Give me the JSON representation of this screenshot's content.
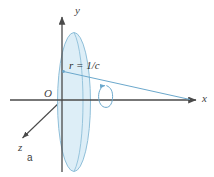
{
  "figure": {
    "caption": "a",
    "type": "3d-axis-diagram",
    "background_color": "#ffffff"
  },
  "axes": {
    "x_label": "x",
    "y_label": "y",
    "z_label": "z",
    "origin_label": "O",
    "axis_color": "#4a4a4a"
  },
  "annotations": {
    "radius_label": "r = 1/c"
  },
  "shapes": {
    "sphere": {
      "name": "sphere-edge-on-ellipse",
      "fill_color": "#d9ecf6",
      "stroke_color": "#6ba8cc"
    },
    "rotation_arrow": {
      "name": "rotation-indicator",
      "stroke_color": "#6ba8cc"
    },
    "radius_line": {
      "stroke_color": "#6ba8cc"
    }
  }
}
